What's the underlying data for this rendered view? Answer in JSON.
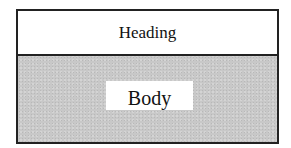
{
  "diagram": {
    "heading": {
      "label": "Heading",
      "background": "#ffffff"
    },
    "body": {
      "label": "Body",
      "background": "#c8c8c8",
      "label_background": "#ffffff"
    },
    "border_color": "#222222"
  }
}
